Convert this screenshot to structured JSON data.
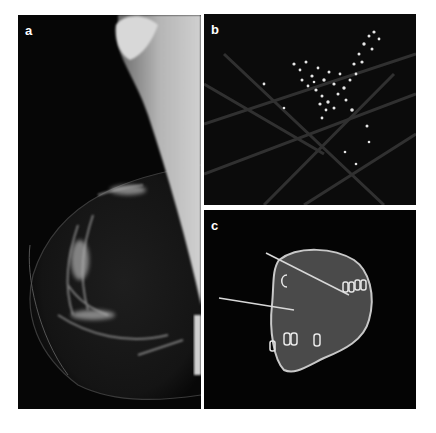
{
  "figure": {
    "background_color": "#ffffff",
    "panels": [
      {
        "id": "a",
        "label": "a",
        "content": "Mediolateral oblique mammogram showing breast tissue and pectoral muscle"
      },
      {
        "id": "b",
        "label": "b",
        "content": "Magnified view showing clustered microcalcifications"
      },
      {
        "id": "c",
        "label": "c",
        "content": "Specimen radiograph with localization wires and surgical clips"
      }
    ]
  }
}
